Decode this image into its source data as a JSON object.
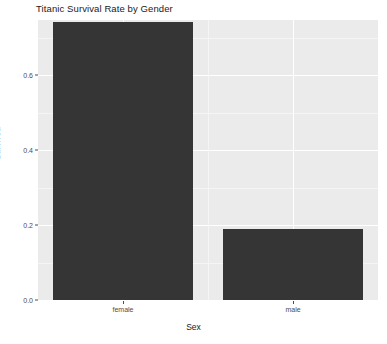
{
  "chart_data": {
    "type": "bar",
    "title": "Titanic Survival Rate by Gender",
    "xlabel": "Sex",
    "ylabel": "Survived",
    "categories": [
      "female",
      "male"
    ],
    "values": [
      0.742,
      0.189
    ],
    "ylim": [
      0.0,
      0.7467
    ],
    "y_ticks": [
      "0.0",
      "0.2",
      "0.4",
      "0.6"
    ],
    "y_tick_values": [
      0.0,
      0.2,
      0.4,
      0.6
    ],
    "y_minor_tick_values": [
      0.1,
      0.3,
      0.5,
      0.7
    ],
    "grid": true,
    "legend": "none",
    "bar_color": "#353535",
    "panel_color": "#ebebeb",
    "grid_color": "#ffffff",
    "background_color": "#ffffff"
  }
}
